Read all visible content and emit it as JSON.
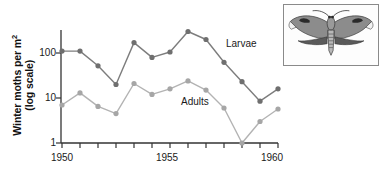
{
  "figure": {
    "inset_caption": "winter-moth-specimen"
  },
  "axes": {
    "y_axis_title_line1": "Winter moths per m",
    "y_axis_title_exponent": "2",
    "y_axis_title_line2": "(log scale)",
    "y_ticks": [
      "100",
      "10",
      "1"
    ],
    "x_ticks_labeled": [
      "1950",
      "1955",
      "1960"
    ]
  },
  "chart_data": {
    "type": "line",
    "title": "",
    "xlabel": "",
    "ylabel": "Winter moths per m2 (log scale)",
    "yscale": "log",
    "ylim": [
      1,
      400
    ],
    "xlim": [
      1950,
      1962
    ],
    "grid": false,
    "legend": "inline-annotations",
    "x": [
      1950,
      1951,
      1952,
      1953,
      1954,
      1955,
      1956,
      1957,
      1958,
      1959,
      1960,
      1961,
      1962
    ],
    "series": [
      {
        "name": "Larvae",
        "color": "#7d7d7d",
        "marker": "circle",
        "values": [
          110,
          110,
          52,
          20,
          170,
          80,
          105,
          300,
          200,
          62,
          23,
          8.5,
          16
        ]
      },
      {
        "name": "Adults",
        "color": "#b3b3b3",
        "marker": "circle",
        "values": [
          7,
          13,
          6.5,
          4.5,
          21,
          12,
          16,
          24,
          15,
          6,
          1,
          3,
          5.7
        ]
      }
    ],
    "annotations": [
      {
        "text": "Larvae",
        "x": 1958.6,
        "y": 150
      },
      {
        "text": "Adults",
        "x": 1955.6,
        "y": 9.5
      }
    ]
  },
  "colors": {
    "axis": "#333333",
    "larvae": "#7d7d7d",
    "adults": "#b3b3b3",
    "text": "#1a1a1a",
    "background": "#ffffff"
  }
}
